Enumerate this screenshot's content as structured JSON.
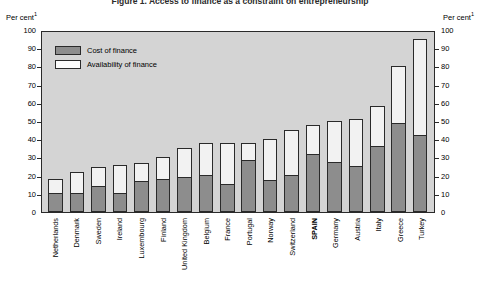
{
  "figure": {
    "title": "Figure 1.  Access to finance as a constraint on entrepreneurship",
    "unit_left": "Per cent",
    "unit_right": "Per cent",
    "unit_superscript": "1"
  },
  "legend": {
    "position": "inside-top-left",
    "items": [
      {
        "label": "Cost of finance",
        "color": "#8d8d8d",
        "name": "cost-of-finance"
      },
      {
        "label": "Availability of finance",
        "color": "#fbfbfb",
        "name": "availability-of-finance"
      }
    ]
  },
  "axis": {
    "ticks": [
      "100",
      "90",
      "80",
      "70",
      "60",
      "50",
      "40",
      "30",
      "20",
      "10",
      "0"
    ]
  },
  "chart_data": {
    "type": "bar",
    "stacked": true,
    "title": "Figure 1.  Access to finance as a constraint on entrepreneurship",
    "xlabel": "",
    "ylabel": "Per cent",
    "ylim": [
      0,
      100
    ],
    "ytick_step": 10,
    "grid": false,
    "legend_position": "inside-top-left",
    "highlight_category": "SPAIN",
    "categories": [
      "Netherlands",
      "Denmark",
      "Sweden",
      "Ireland",
      "Luxembourg",
      "Finland",
      "United Kingdom",
      "Belgium",
      "France",
      "Portugal",
      "Norway",
      "Switzerland",
      "SPAIN",
      "Germany",
      "Austria",
      "Italy",
      "Greece",
      "Turkey"
    ],
    "series": [
      {
        "name": "Cost of finance",
        "color": "#8d8d8d",
        "values": [
          10,
          10,
          14,
          10,
          17,
          18,
          19,
          20,
          15,
          29,
          17,
          20,
          32,
          27,
          25,
          36,
          49,
          42
        ]
      },
      {
        "name": "Availability of finance",
        "color": "#fbfbfb",
        "values": [
          8,
          12,
          11,
          16,
          10,
          12,
          16,
          18,
          23,
          9,
          23,
          25,
          16,
          23,
          26,
          22,
          31,
          53
        ]
      }
    ],
    "totals": [
      18,
      22,
      25,
      26,
      27,
      30,
      35,
      38,
      38,
      38,
      40,
      45,
      48,
      50,
      51,
      58,
      80,
      95
    ]
  }
}
